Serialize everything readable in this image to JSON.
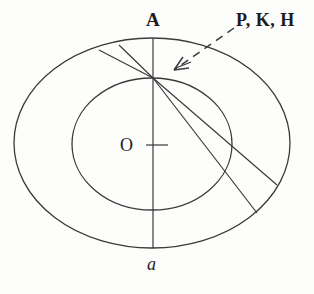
{
  "figure": {
    "type": "geometric-diagram",
    "background_color": "#fdfdfc",
    "stroke_color": "#3a3a3a",
    "stroke_width": 1.2,
    "labels": {
      "apex": "A",
      "center": "O",
      "bottom": "a",
      "annotation": "P, K, H"
    },
    "ellipses": [
      {
        "name": "outer-ellipse",
        "cx": 152,
        "cy": 143,
        "rx": 138,
        "ry": 105
      },
      {
        "name": "inner-ellipse",
        "cx": 152,
        "cy": 144,
        "rx": 80,
        "ry": 66
      }
    ],
    "axis": {
      "name": "vertical-axis",
      "x": 153,
      "y_top": 38,
      "y_bottom": 248
    },
    "center_tick": {
      "name": "center-tick-mark",
      "x1": 148,
      "x2": 168,
      "y": 145
    },
    "convergence_point": {
      "x": 153,
      "y": 78
    },
    "chords": [
      {
        "name": "chord-upper-left-outer",
        "x1": 153,
        "y1": 78,
        "x2": 100,
        "y2": 49
      },
      {
        "name": "chord-upper-left-inner",
        "x1": 153,
        "y1": 78,
        "x2": 119,
        "y2": 45
      },
      {
        "name": "chord-lower-right-upper",
        "x1": 153,
        "y1": 78,
        "x2": 277,
        "y2": 185
      },
      {
        "name": "chord-lower-right-lower",
        "x1": 153,
        "y1": 78,
        "x2": 257,
        "y2": 213
      }
    ],
    "pointer": {
      "name": "dashed-arrow",
      "x1": 234,
      "y1": 28,
      "x2": 170,
      "y2": 73,
      "dash_pattern": "7 5",
      "arrowhead": true
    }
  }
}
